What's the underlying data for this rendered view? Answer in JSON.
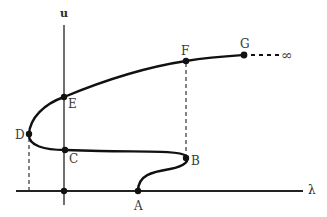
{
  "diagram": {
    "type": "bifurcation-diagram",
    "axes": {
      "vertical_label": "u",
      "horizontal_label": "λ"
    },
    "points": [
      {
        "id": "A",
        "label": "A"
      },
      {
        "id": "B",
        "label": "B"
      },
      {
        "id": "C",
        "label": "C"
      },
      {
        "id": "D",
        "label": "D"
      },
      {
        "id": "E",
        "label": "E"
      },
      {
        "id": "F",
        "label": "F"
      },
      {
        "id": "G",
        "label": "G"
      }
    ],
    "infinity_label": "∞",
    "colors": {
      "curve": "#111111",
      "axis": "#222222",
      "text": "#3a3a3a"
    }
  }
}
